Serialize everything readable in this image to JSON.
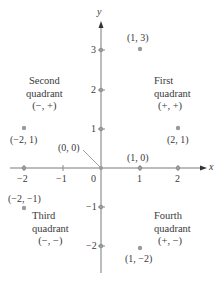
{
  "diagram": {
    "type": "coordinate-plane",
    "axes": {
      "x_label": "x",
      "y_label": "y",
      "x_ticks": [
        "−2",
        "−1",
        "0",
        "1",
        "2"
      ],
      "y_ticks": [
        "3",
        "2",
        "1",
        "−1",
        "−2"
      ]
    },
    "colors": {
      "axis": "#7a7a7a",
      "point": "#9a9a9a",
      "text": "#3a3a3a"
    },
    "points": [
      {
        "label": "(1, 3)",
        "x": 1,
        "y": 3
      },
      {
        "label": "(2, 1)",
        "x": 2,
        "y": 1
      },
      {
        "label": "(−2, 1)",
        "x": -2,
        "y": 1
      },
      {
        "label": "(0, 0)",
        "x": 0,
        "y": 0
      },
      {
        "label": "(1, 0)",
        "x": 1,
        "y": 0
      },
      {
        "label": "(−2, −1)",
        "x": -2,
        "y": -1
      },
      {
        "label": "(1, −2)",
        "x": 1,
        "y": -2
      }
    ],
    "quadrants": [
      {
        "name": "First",
        "line2": "quadrant",
        "signs": "(+, +)"
      },
      {
        "name": "Second",
        "line2": "quadrant",
        "signs": "(−, +)"
      },
      {
        "name": "Third",
        "line2": "quadrant",
        "signs": "(−, −)"
      },
      {
        "name": "Fourth",
        "line2": "quadrant",
        "signs": "(+, −)"
      }
    ]
  }
}
